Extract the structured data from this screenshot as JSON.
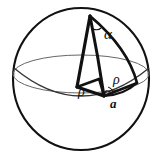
{
  "figure": {
    "kind": "geometry-diagram",
    "background_color": "#ffffff",
    "stroke_color": "#111111",
    "thin_stroke_color": "#555555",
    "labels": {
      "alpha_top": "α",
      "rho_right": "ρ",
      "alpha_bottom": "α",
      "rho_left": "ρ",
      "a_bottom": "a"
    },
    "elements": {
      "sphere_outline": "sphere-outline",
      "equator_ellipse": "equator-ellipse",
      "wedge_face": "wedge-flat-face",
      "wedge_arc": "wedge-curved-edge",
      "radius_segment_left": "radius-rho-left",
      "radius_segment_right": "radius-rho-right",
      "base_arc": "base-arc-a",
      "polar_axis": "polar-axis"
    }
  }
}
